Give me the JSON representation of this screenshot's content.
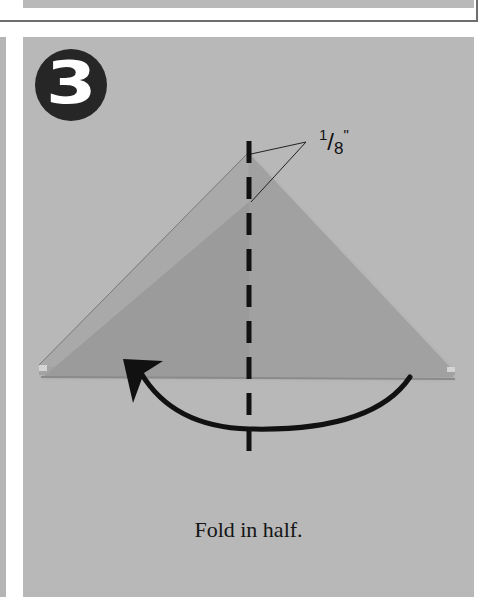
{
  "step": {
    "number": "3",
    "instruction": "Fold in half."
  },
  "annotation": {
    "measure_numerator": "1",
    "measure_slash": "/",
    "measure_denominator": "8",
    "measure_unit": "\""
  },
  "icons": {
    "fold_arrow": "curved-arrow-left",
    "fold_line": "dashed-valley-fold-line"
  },
  "colors": {
    "panel_background": "#b8b8b8",
    "paper": "#9a9a9a",
    "badge": "#262626",
    "line": "#111111"
  }
}
